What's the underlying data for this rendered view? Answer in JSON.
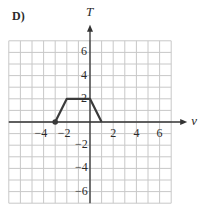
{
  "panel_label": "D)",
  "chart_data": {
    "type": "line",
    "title": "",
    "xlabel": "v",
    "ylabel": "T",
    "xlim": [
      -7,
      7
    ],
    "ylim": [
      -7,
      7
    ],
    "grid": true,
    "x_ticks": [
      -4,
      -2,
      2,
      4,
      6
    ],
    "y_ticks": [
      6,
      4,
      2,
      -2,
      -4,
      -6
    ],
    "x_tick_labels": [
      "−4",
      "−2",
      "2",
      "4",
      "6"
    ],
    "y_tick_labels": [
      "6",
      "4",
      "2",
      "−2",
      "−4",
      "−6"
    ],
    "series": [
      {
        "name": "T(v)",
        "points": [
          [
            -3,
            0
          ],
          [
            -2,
            2
          ],
          [
            0,
            2
          ],
          [
            1,
            0
          ]
        ],
        "start_marker": "closed-dot"
      }
    ],
    "colors": {
      "grid": "#c8c8c8",
      "axis": "#333333",
      "curve": "#3a3a3a"
    }
  }
}
